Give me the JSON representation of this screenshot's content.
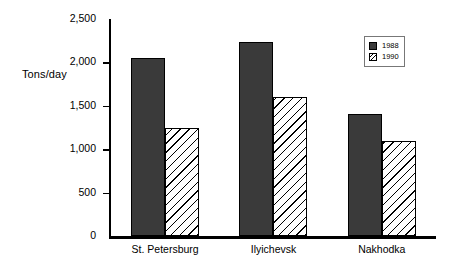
{
  "chart_data": {
    "type": "bar",
    "title": "",
    "xlabel": "",
    "ylabel": "Tons/day",
    "categories": [
      "St. Petersburg",
      "Ilyichevsk",
      "Nakhodka"
    ],
    "series": [
      {
        "name": "1988",
        "values": [
          2050,
          2230,
          1400
        ],
        "style": "solid",
        "color": "#3a3a3a"
      },
      {
        "name": "1990",
        "values": [
          1250,
          1600,
          1100
        ],
        "style": "hatch",
        "color": "#ffffff"
      }
    ],
    "ylim": [
      0,
      2500
    ],
    "yticks": [
      0,
      500,
      1000,
      1500,
      2000,
      2500
    ],
    "ytick_labels": [
      "0",
      "500",
      "1,000",
      "1,500",
      "2,000",
      "2,500"
    ],
    "grid": false,
    "legend_position": "top-right"
  },
  "axis": {
    "y_title": "Tons/day"
  },
  "legend": {
    "entries": [
      {
        "label": "1988"
      },
      {
        "label": "1990"
      }
    ]
  }
}
